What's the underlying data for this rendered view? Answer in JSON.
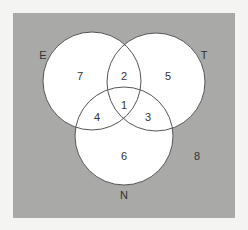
{
  "diagram": {
    "type": "venn-3",
    "background_color": "#f4f4f2",
    "panel_color": "#a9a9a7",
    "circle_fill": "#ffffff",
    "circle_stroke": "#555555",
    "sets": [
      {
        "name": "E",
        "label": "E"
      },
      {
        "name": "T",
        "label": "T"
      },
      {
        "name": "N",
        "label": "N"
      }
    ],
    "regions": {
      "E_only": "7",
      "E_and_T_only": "2",
      "T_only": "5",
      "E_and_T_and_N": "1",
      "E_and_N_only": "4",
      "T_and_N_only": "3",
      "N_only": "6",
      "outside": "8"
    }
  }
}
